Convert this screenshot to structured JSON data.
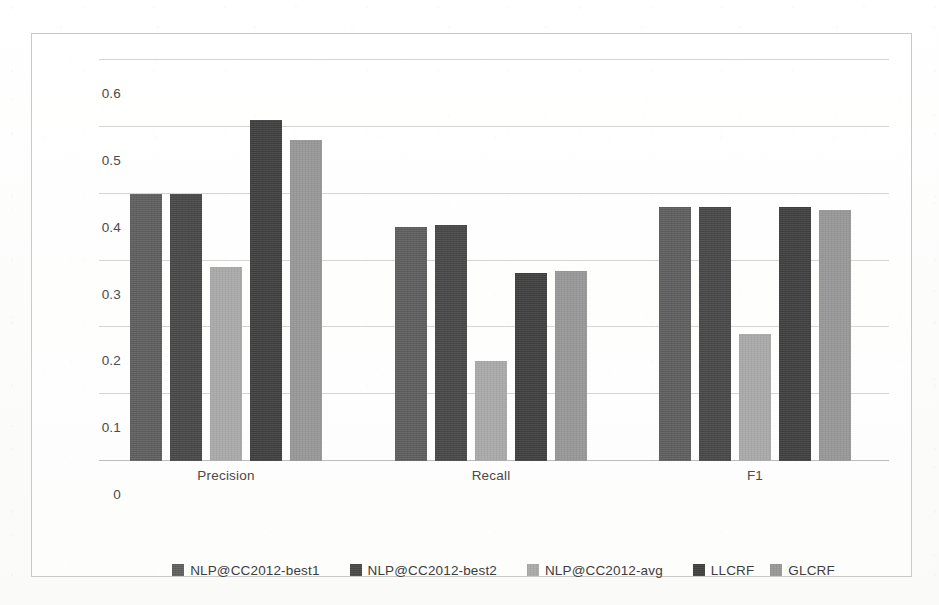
{
  "chart_data": {
    "type": "bar",
    "title": "",
    "subtitle": "",
    "xlabel": "",
    "ylabel": "",
    "categories": [
      "Precision",
      "Recall",
      "F1"
    ],
    "ylim": [
      0,
      0.6
    ],
    "yticks": [
      "0",
      "0.1",
      "0.2",
      "0.3",
      "0.4",
      "0.5",
      "0.6"
    ],
    "ytick_values": [
      0,
      0.1,
      0.2,
      0.3,
      0.4,
      0.5,
      0.6
    ],
    "grid": true,
    "legend_position": "bottom",
    "series": [
      {
        "name": "NLP@CC2012-best1",
        "color": "#5e5e5e",
        "values": [
          0.4,
          0.35,
          0.38
        ]
      },
      {
        "name": "NLP@CC2012-best2",
        "color": "#474747",
        "values": [
          0.4,
          0.353,
          0.38
        ]
      },
      {
        "name": "NLP@CC2012-avg",
        "color": "#a9a9a9",
        "values": [
          0.29,
          0.15,
          0.19
        ]
      },
      {
        "name": "LLCRF",
        "color": "#3f3f3f",
        "values": [
          0.51,
          0.282,
          0.38
        ]
      },
      {
        "name": "GLCRF",
        "color": "#979797",
        "values": [
          0.48,
          0.285,
          0.375
        ]
      }
    ]
  },
  "legend": {
    "items": [
      {
        "label": "NLP@CC2012-best1",
        "color": "#5e5e5e"
      },
      {
        "label": "NLP@CC2012-best2",
        "color": "#474747"
      },
      {
        "label": "NLP@CC2012-avg",
        "color": "#a9a9a9"
      },
      {
        "label": "LLCRF",
        "color": "#3f3f3f"
      },
      {
        "label": "GLCRF",
        "color": "#979797"
      }
    ]
  },
  "axes": {
    "y_tick_labels": [
      "0.6",
      "0.5",
      "0.4",
      "0.3",
      "0.2",
      "0.1",
      "0"
    ],
    "x_category_labels": [
      "Precision",
      "Recall",
      "F1"
    ]
  },
  "style": {
    "frame_border_color": "#c9c9c9",
    "gridline_color": "#d5d5d5",
    "axis_color": "#bdbdbd",
    "text_color": "#4a4a4a",
    "background_color": "#fdfdfd"
  }
}
